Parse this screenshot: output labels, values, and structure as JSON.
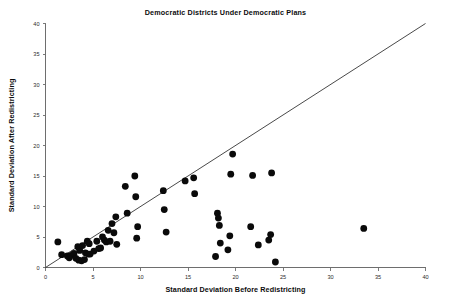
{
  "chart_data": {
    "type": "scatter",
    "title": "Democratic Districts Under Democratic Plans",
    "xlabel": "Standard Deviation Before Redistricting",
    "ylabel": "Standard Deviation After Redistricting",
    "xlim": [
      0,
      40
    ],
    "ylim": [
      0,
      40
    ],
    "xticks": [
      0,
      5,
      10,
      15,
      20,
      25,
      30,
      35,
      40
    ],
    "yticks": [
      0,
      5,
      10,
      15,
      20,
      25,
      30,
      35,
      40
    ],
    "xtick_labels": [
      "0",
      "5",
      "10",
      "15",
      "20",
      "25",
      "30",
      "35",
      "40"
    ],
    "ytick_labels": [
      "0",
      "5",
      "10",
      "15",
      "20",
      "25",
      "30",
      "35",
      "40"
    ],
    "grid": false,
    "legend": null,
    "marker": "filled-circle",
    "marker_color": "#0a0a0a",
    "marker_size": 3.4,
    "reference_line": {
      "name": "identity-line",
      "description": "y = x diagonal reference line",
      "x": [
        0,
        40
      ],
      "y": [
        0,
        40
      ],
      "color": "#1b1b1b"
    },
    "series": [
      {
        "name": "Democratic districts",
        "points": [
          [
            1.3,
            4.2
          ],
          [
            1.7,
            2.1
          ],
          [
            2.3,
            1.9
          ],
          [
            2.5,
            1.6
          ],
          [
            2.7,
            2.0
          ],
          [
            3.0,
            2.3
          ],
          [
            3.2,
            1.5
          ],
          [
            3.4,
            3.4
          ],
          [
            3.5,
            1.2
          ],
          [
            3.6,
            2.8
          ],
          [
            3.8,
            1.1
          ],
          [
            3.9,
            3.6
          ],
          [
            4.1,
            1.3
          ],
          [
            4.2,
            2.4
          ],
          [
            4.4,
            4.3
          ],
          [
            4.5,
            2.2
          ],
          [
            4.6,
            3.9
          ],
          [
            4.7,
            2.2
          ],
          [
            5.1,
            2.7
          ],
          [
            5.4,
            4.3
          ],
          [
            5.6,
            3.1
          ],
          [
            5.8,
            3.2
          ],
          [
            6.0,
            5.0
          ],
          [
            6.2,
            4.5
          ],
          [
            6.4,
            4.2
          ],
          [
            6.6,
            6.1
          ],
          [
            6.8,
            4.3
          ],
          [
            7.0,
            7.2
          ],
          [
            7.2,
            5.7
          ],
          [
            7.4,
            8.3
          ],
          [
            7.5,
            3.8
          ],
          [
            8.4,
            13.3
          ],
          [
            8.6,
            8.9
          ],
          [
            9.4,
            15.0
          ],
          [
            9.5,
            11.6
          ],
          [
            9.6,
            4.8
          ],
          [
            9.7,
            6.7
          ],
          [
            12.4,
            12.6
          ],
          [
            12.5,
            9.5
          ],
          [
            12.7,
            5.8
          ],
          [
            14.7,
            14.2
          ],
          [
            15.6,
            14.7
          ],
          [
            15.7,
            12.1
          ],
          [
            17.9,
            1.8
          ],
          [
            18.1,
            8.9
          ],
          [
            18.2,
            8.1
          ],
          [
            18.3,
            6.9
          ],
          [
            18.4,
            4.0
          ],
          [
            19.2,
            2.9
          ],
          [
            19.4,
            5.2
          ],
          [
            19.5,
            15.3
          ],
          [
            19.7,
            18.6
          ],
          [
            21.6,
            6.7
          ],
          [
            21.8,
            15.1
          ],
          [
            22.4,
            3.7
          ],
          [
            23.5,
            4.5
          ],
          [
            23.7,
            5.4
          ],
          [
            23.8,
            15.5
          ],
          [
            24.2,
            0.9
          ],
          [
            33.5,
            6.4
          ]
        ]
      }
    ]
  }
}
